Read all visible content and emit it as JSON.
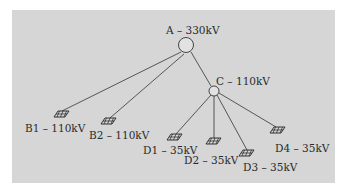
{
  "diagram": {
    "type": "power-network-tree",
    "colors": {
      "background": "#d6d6d6",
      "line": "#333333",
      "page": "#ffffff"
    },
    "nodes": [
      {
        "id": "A",
        "label": "A – 330kV",
        "kind": "substation",
        "x": 186,
        "y": 45
      },
      {
        "id": "C",
        "label": "C – 110kV",
        "kind": "substation",
        "x": 214,
        "y": 91
      },
      {
        "id": "B1",
        "label": "B1 – 110kV",
        "kind": "load",
        "x": 60,
        "y": 113
      },
      {
        "id": "B2",
        "label": "B2 – 110kV",
        "kind": "load",
        "x": 108,
        "y": 121
      },
      {
        "id": "D1",
        "label": "D1 – 35kV",
        "kind": "load",
        "x": 175,
        "y": 137
      },
      {
        "id": "D2",
        "label": "D2 – 35kV",
        "kind": "load",
        "x": 213,
        "y": 140
      },
      {
        "id": "D3",
        "label": "D3 – 35kV",
        "kind": "load",
        "x": 246,
        "y": 153
      },
      {
        "id": "D4",
        "label": "D4 – 35kV",
        "kind": "load",
        "x": 276,
        "y": 130
      }
    ],
    "edges": [
      [
        "A",
        "B1"
      ],
      [
        "A",
        "B2"
      ],
      [
        "A",
        "C"
      ],
      [
        "C",
        "D1"
      ],
      [
        "C",
        "D2"
      ],
      [
        "C",
        "D3"
      ],
      [
        "C",
        "D4"
      ]
    ]
  }
}
